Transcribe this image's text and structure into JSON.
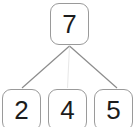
{
  "diagram": {
    "type": "tree",
    "background_color": "#ffffff",
    "node_border_color": "#9a9a9a",
    "node_fill_color": "#ffffff",
    "node_text_color": "#1c1c1c",
    "edge_color": "#8c8c8c",
    "root": {
      "id": "root",
      "label": "7"
    },
    "children": [
      {
        "id": "child-0",
        "label": "2"
      },
      {
        "id": "child-1",
        "label": "4"
      },
      {
        "id": "child-2",
        "label": "5"
      }
    ],
    "edges": [
      {
        "from": "root",
        "to": "child-0"
      },
      {
        "from": "root",
        "to": "child-1"
      },
      {
        "from": "root",
        "to": "child-2"
      }
    ]
  }
}
